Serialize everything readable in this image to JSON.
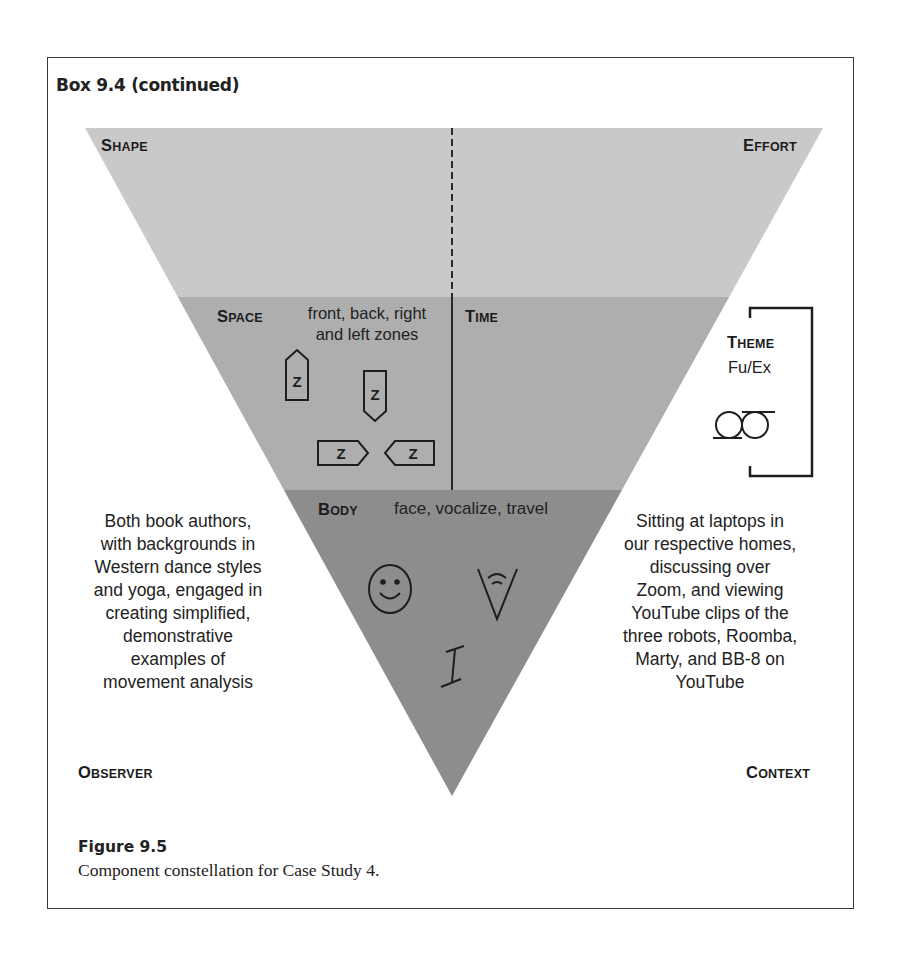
{
  "box": {
    "title": "Box 9.4 (continued)"
  },
  "diagram": {
    "colors": {
      "band_top": "#c9c9c9",
      "band_middle": "#aeaeae",
      "band_bottom": "#8d8d8d",
      "line": "#2a2a2a"
    },
    "corners": {
      "shape": {
        "cap": "S",
        "rest": "HAPE"
      },
      "effort": {
        "cap": "E",
        "rest": "FFORT"
      },
      "observer": {
        "cap": "O",
        "rest": "BSERVER"
      },
      "context": {
        "cap": "C",
        "rest": "ONTEXT"
      }
    },
    "space": {
      "label": {
        "cap": "S",
        "rest": "PACE"
      },
      "description_lines": [
        "front, back, right",
        "and left zones"
      ],
      "zone_symbols": [
        "front-zone",
        "back-zone",
        "right-zone",
        "left-zone"
      ],
      "zone_glyph": "Z"
    },
    "time": {
      "label": {
        "cap": "T",
        "rest": "IME"
      }
    },
    "theme": {
      "label": {
        "cap": "T",
        "rest": "HEME"
      },
      "value": "Fu/Ex"
    },
    "body": {
      "label": {
        "cap": "B",
        "rest": "ODY"
      },
      "description": "face, vocalize, travel",
      "symbols": [
        "face",
        "vocalize",
        "travel"
      ]
    },
    "observer_text": [
      "Both book authors,",
      "with backgrounds in",
      "Western dance styles",
      "and yoga, engaged in",
      "creating simplified,",
      "demonstrative",
      "examples of",
      "movement analysis"
    ],
    "context_text": [
      "Sitting at laptops in",
      "our respective homes,",
      "discussing over",
      "Zoom, and viewing",
      "YouTube clips of the",
      "three robots, Roomba,",
      "Marty, and BB-8 on",
      "YouTube"
    ]
  },
  "caption": {
    "label": "Figure 9.5",
    "text": "Component constellation for Case Study 4."
  }
}
